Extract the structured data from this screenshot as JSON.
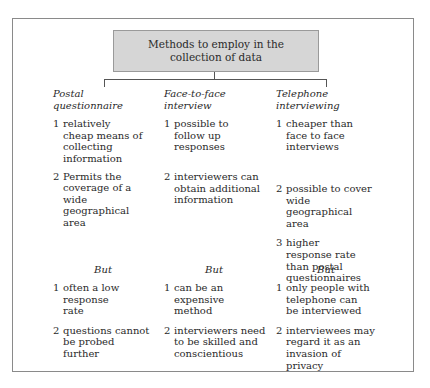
{
  "title": "Methods to employ in the collection of data",
  "columns": [
    {
      "heading": "Postal questionnaire",
      "advantages": [
        {
          "num": "1",
          "text": "relatively cheap means of collecting information"
        },
        {
          "num": "2",
          "text": "Permits the coverage of a wide geographical area"
        }
      ],
      "but_label": "But",
      "disadvantages": [
        {
          "num": "1",
          "text": "often a low response rate"
        },
        {
          "num": "2",
          "text": "questions cannot be probed further"
        }
      ]
    },
    {
      "heading": "Face-to-face interview",
      "advantages": [
        {
          "num": "1",
          "text": "possible to follow up responses"
        },
        {
          "num": "2",
          "text": "interviewers can obtain additional information"
        }
      ],
      "but_label": "But",
      "disadvantages": [
        {
          "num": "1",
          "text": "can be an expensive method"
        },
        {
          "num": "2",
          "text": "interviewers need to be skilled and conscientious"
        }
      ]
    },
    {
      "heading": "Telephone interviewing",
      "advantages": [
        {
          "num": "1",
          "text": "cheaper than face to face interviews"
        },
        {
          "num": "2",
          "text": "possible to cover wide geographical area"
        },
        {
          "num": "3",
          "text": "higher response rate than postal questionnaires"
        }
      ],
      "but_label": "But",
      "disadvantages": [
        {
          "num": "1",
          "text": "only people with telephone can be interviewed"
        },
        {
          "num": "2",
          "text": "interviewees may regard it as an invasion of privacy"
        }
      ]
    }
  ]
}
